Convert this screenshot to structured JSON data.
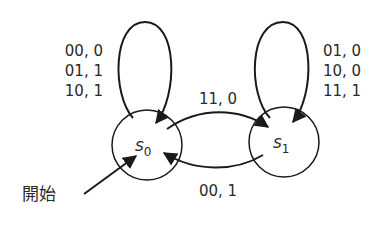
{
  "diagram": {
    "type": "finite-state-machine",
    "states": [
      {
        "id": "s0",
        "name": "s",
        "subscript": "0",
        "initial": true
      },
      {
        "id": "s1",
        "name": "s",
        "subscript": "1",
        "initial": false
      }
    ],
    "start_label": "開始",
    "transitions": [
      {
        "from": "s0",
        "to": "s0",
        "labels": [
          "00, 0",
          "01, 1",
          "10, 1"
        ]
      },
      {
        "from": "s1",
        "to": "s1",
        "labels": [
          "01, 0",
          "10, 0",
          "11, 1"
        ]
      },
      {
        "from": "s0",
        "to": "s1",
        "labels": [
          "11, 0"
        ]
      },
      {
        "from": "s1",
        "to": "s0",
        "labels": [
          "00, 1"
        ]
      }
    ]
  }
}
